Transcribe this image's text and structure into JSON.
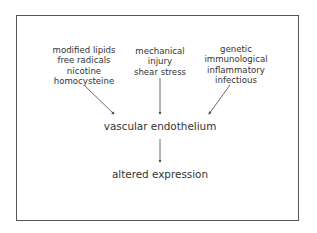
{
  "diagram": {
    "causes": [
      {
        "id": "chemical",
        "lines": [
          "modified lipids",
          "free radicals",
          "nicotine",
          "homocysteine"
        ]
      },
      {
        "id": "mechanical",
        "lines": [
          "mechanical",
          "injury",
          "shear stress"
        ]
      },
      {
        "id": "biological",
        "lines": [
          "genetic",
          "immunological",
          "inflammatory",
          "infectious"
        ]
      }
    ],
    "target": "vascular endothelium",
    "outcome": "altered expression",
    "edges": [
      {
        "from": "chemical",
        "to": "target"
      },
      {
        "from": "mechanical",
        "to": "target"
      },
      {
        "from": "biological",
        "to": "target"
      },
      {
        "from": "target",
        "to": "outcome"
      }
    ],
    "colors": {
      "text": "#333333",
      "lines": "#444444",
      "border": "#555555",
      "background": "#ffffff"
    }
  }
}
